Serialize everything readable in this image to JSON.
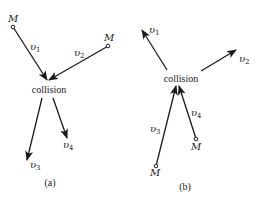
{
  "diagram": {
    "panels": [
      {
        "id": "a",
        "caption": "(a)",
        "center_label": "collision",
        "mass_labels": [
          "M",
          "M"
        ],
        "vectors": [
          {
            "label": "υ",
            "sub": "1",
            "role": "incoming"
          },
          {
            "label": "υ",
            "sub": "2",
            "role": "incoming"
          },
          {
            "label": "υ",
            "sub": "3",
            "role": "outgoing"
          },
          {
            "label": "υ",
            "sub": "4",
            "role": "outgoing"
          }
        ]
      },
      {
        "id": "b",
        "caption": "(b)",
        "center_label": "collision",
        "mass_labels": [
          "M",
          "M"
        ],
        "vectors": [
          {
            "label": "υ",
            "sub": "1",
            "role": "outgoing"
          },
          {
            "label": "υ",
            "sub": "2",
            "role": "outgoing"
          },
          {
            "label": "υ",
            "sub": "3",
            "role": "incoming"
          },
          {
            "label": "υ",
            "sub": "4",
            "role": "incoming"
          }
        ]
      }
    ],
    "colors": {
      "ink": "#1a1a1a",
      "background": "#ffffff"
    }
  }
}
